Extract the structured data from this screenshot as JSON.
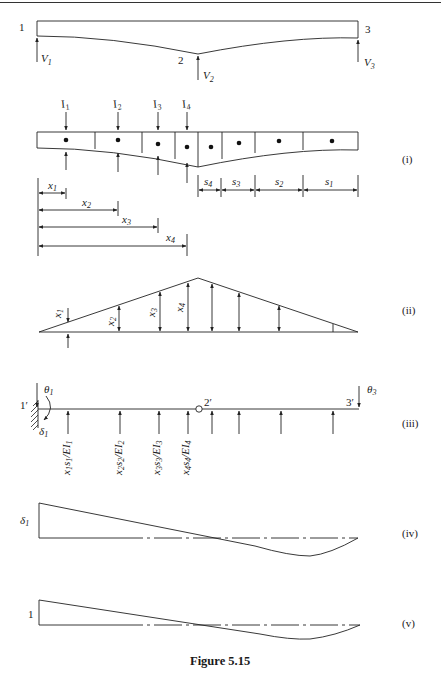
{
  "figure": {
    "caption": "Figure 5.15",
    "top_rule": true
  },
  "beam": {
    "node_labels": [
      "1",
      "2",
      "3"
    ],
    "reactions": [
      {
        "symbol": "V",
        "sub": "1"
      },
      {
        "symbol": "V",
        "sub": "2"
      },
      {
        "symbol": "V",
        "sub": "3"
      }
    ]
  },
  "panel_i": {
    "tag": "(i)",
    "moments_of_inertia": [
      {
        "symbol": "I",
        "sub": "1"
      },
      {
        "symbol": "I",
        "sub": "2"
      },
      {
        "symbol": "I",
        "sub": "3"
      },
      {
        "symbol": "I",
        "sub": "4"
      }
    ],
    "segment_lengths": [
      {
        "symbol": "s",
        "sub": "4"
      },
      {
        "symbol": "s",
        "sub": "3"
      },
      {
        "symbol": "s",
        "sub": "2"
      },
      {
        "symbol": "s",
        "sub": "1"
      }
    ],
    "distances": [
      {
        "symbol": "x",
        "sub": "1"
      },
      {
        "symbol": "x",
        "sub": "2"
      },
      {
        "symbol": "x",
        "sub": "3"
      },
      {
        "symbol": "x",
        "sub": "4"
      }
    ]
  },
  "panel_ii": {
    "tag": "(ii)",
    "ordinates": [
      {
        "symbol": "x",
        "sub": "1"
      },
      {
        "symbol": "x",
        "sub": "2"
      },
      {
        "symbol": "x",
        "sub": "3"
      },
      {
        "symbol": "x",
        "sub": "4"
      }
    ]
  },
  "panel_iii": {
    "tag": "(iii)",
    "node_labels": [
      "1′",
      "2′",
      "3′"
    ],
    "rotations": [
      {
        "symbol": "θ",
        "sub": "1"
      },
      {
        "symbol": "θ",
        "sub": "3"
      }
    ],
    "deflection": {
      "symbol": "δ",
      "sub": "1"
    },
    "elastic_loads": [
      {
        "a": "x",
        "as": "1",
        "b": "s",
        "bs": "1",
        "c": "/EI",
        "cs": "1"
      },
      {
        "a": "x",
        "as": "2",
        "b": "s",
        "bs": "2",
        "c": "/EI",
        "cs": "2"
      },
      {
        "a": "x",
        "as": "3",
        "b": "s",
        "bs": "3",
        "c": "/EI",
        "cs": "3"
      },
      {
        "a": "x",
        "as": "4",
        "b": "s",
        "bs": "4",
        "c": "/EI",
        "cs": "4"
      }
    ]
  },
  "panel_iv": {
    "tag": "(iv)",
    "ordinate": {
      "symbol": "δ",
      "sub": "1"
    }
  },
  "panel_v": {
    "tag": "(v)",
    "ordinate": "1"
  }
}
